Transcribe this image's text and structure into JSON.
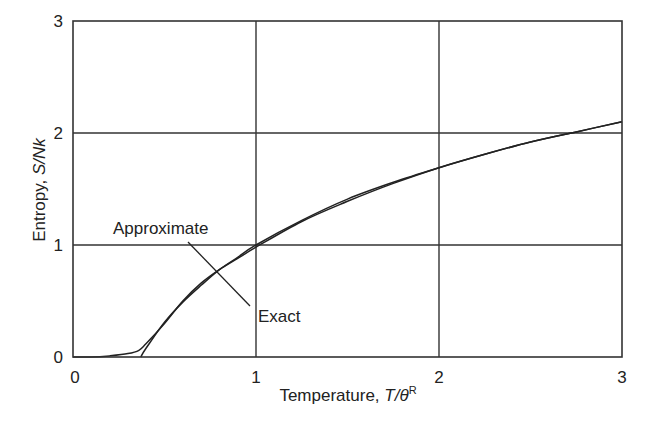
{
  "chart_data": {
    "type": "line",
    "title": "",
    "xlabel": "Temperature, T/θ^R",
    "xlabel_parts": {
      "main": "Temperature, ",
      "italic": "T/θ",
      "sup": "R"
    },
    "ylabel": "Entropy, S/Nk",
    "ylabel_parts": {
      "main": "Entropy, ",
      "italic": "S/Nk"
    },
    "xlim": [
      0,
      3
    ],
    "ylim": [
      0,
      3
    ],
    "xticks": [
      "0",
      "1",
      "2",
      "3"
    ],
    "yticks": [
      "0",
      "1",
      "2",
      "3"
    ],
    "grid": true,
    "series": [
      {
        "name": "Exact",
        "x": [
          0,
          0.1,
          0.2,
          0.3,
          0.36,
          0.4,
          0.5,
          0.6,
          0.7,
          0.8,
          0.9,
          1.0,
          1.25,
          1.5,
          1.75,
          2.0,
          2.25,
          2.5,
          2.75,
          3.0
        ],
        "y": [
          0,
          0.0,
          0.01,
          0.03,
          0.06,
          0.12,
          0.3,
          0.5,
          0.66,
          0.78,
          0.88,
          0.98,
          1.21,
          1.39,
          1.55,
          1.69,
          1.81,
          1.92,
          2.01,
          2.1
        ]
      },
      {
        "name": "Approximate",
        "x": [
          0.37,
          0.4,
          0.5,
          0.6,
          0.7,
          0.8,
          0.9,
          1.0,
          1.25,
          1.5,
          1.75,
          2.0,
          2.25,
          2.5,
          2.75,
          3.0
        ],
        "y": [
          0.0,
          0.08,
          0.31,
          0.49,
          0.64,
          0.78,
          0.89,
          1.0,
          1.22,
          1.41,
          1.56,
          1.69,
          1.81,
          1.92,
          2.01,
          2.1
        ]
      }
    ],
    "annotations": [
      {
        "text": "Approximate",
        "x_px": 113,
        "y_px": 234
      },
      {
        "text": "Exact",
        "x_px": 258,
        "y_px": 322
      }
    ]
  }
}
